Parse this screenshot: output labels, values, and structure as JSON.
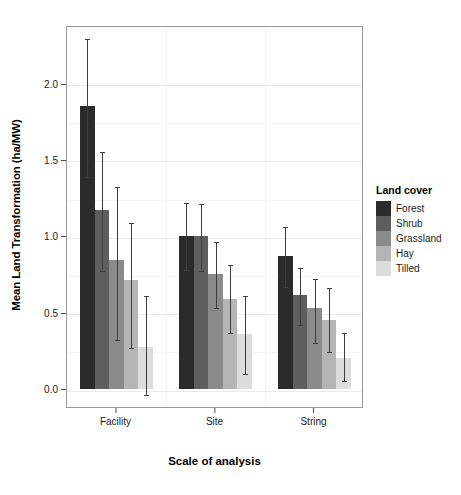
{
  "chart_data": {
    "type": "bar",
    "title": "",
    "xlabel": "Scale of analysis",
    "ylabel": "Mean Land Transformation (ha/MW)",
    "categories": [
      "Facility",
      "Site",
      "String"
    ],
    "ylim": [
      -0.12,
      2.38
    ],
    "yticks": [
      0.0,
      0.5,
      1.0,
      1.5,
      2.0
    ],
    "ytick_labels": [
      "0.0",
      "0.5",
      "1.0",
      "1.5",
      "2.0"
    ],
    "grid": true,
    "legend_position": "right",
    "legend_title": "Land cover",
    "error_bars": "yes",
    "series": [
      {
        "name": "Forest",
        "color": "#2b2b2b",
        "values": [
          1.85,
          1.0,
          0.87
        ],
        "err_low": [
          1.4,
          0.79,
          0.68
        ],
        "err_high": [
          2.3,
          1.23,
          1.07
        ]
      },
      {
        "name": "Shrub",
        "color": "#5e5e5e",
        "values": [
          1.17,
          1.0,
          0.61
        ],
        "err_low": [
          0.78,
          0.78,
          0.43
        ],
        "err_high": [
          1.56,
          1.22,
          0.8
        ]
      },
      {
        "name": "Grassland",
        "color": "#8a8a8a",
        "values": [
          0.84,
          0.75,
          0.53
        ],
        "err_low": [
          0.33,
          0.54,
          0.31
        ],
        "err_high": [
          1.33,
          0.97,
          0.73
        ]
      },
      {
        "name": "Hay",
        "color": "#b5b5b5",
        "values": [
          0.71,
          0.59,
          0.45
        ],
        "err_low": [
          0.28,
          0.38,
          0.25
        ],
        "err_high": [
          1.1,
          0.82,
          0.67
        ]
      },
      {
        "name": "Tilled",
        "color": "#dcdcdc",
        "values": [
          0.27,
          0.36,
          0.2
        ],
        "err_low": [
          -0.03,
          0.11,
          0.06
        ],
        "err_high": [
          0.62,
          0.62,
          0.38
        ]
      }
    ]
  }
}
